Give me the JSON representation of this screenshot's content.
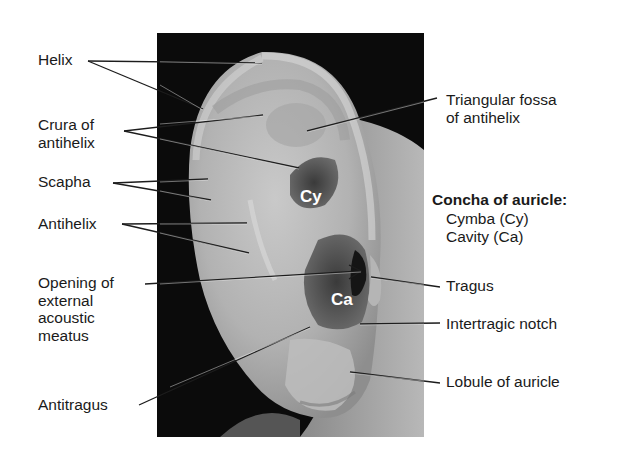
{
  "figure": {
    "photo_region": {
      "x": 157,
      "y": 33,
      "width": 267,
      "height": 404
    },
    "colors": {
      "background": "#ffffff",
      "photo_bg": "#0a0a0a",
      "skin_light": "#cfcfcf",
      "skin_mid": "#a8a8a8",
      "skin_dark": "#4a4a4a",
      "leader_line": "#222222",
      "text": "#1a1a1a",
      "photo_label": "#ffffff"
    }
  },
  "labels_left": [
    {
      "id": "helix",
      "text": "Helix",
      "x": 38,
      "y": 51
    },
    {
      "id": "crura",
      "text": "Crura of\nantihelix",
      "x": 38,
      "y": 116
    },
    {
      "id": "scapha",
      "text": "Scapha",
      "x": 38,
      "y": 173
    },
    {
      "id": "antihelix",
      "text": "Antihelix",
      "x": 38,
      "y": 215
    },
    {
      "id": "opening",
      "text": "Opening of\nexternal\nacoustic\nmeatus",
      "x": 38,
      "y": 272
    },
    {
      "id": "antitragus",
      "text": "Antitragus",
      "x": 38,
      "y": 397
    }
  ],
  "labels_right": [
    {
      "id": "triangular-fossa",
      "text": "Triangular fossa\nof antihelix",
      "x": 446,
      "y": 92
    },
    {
      "id": "tragus",
      "text": "Tragus",
      "x": 446,
      "y": 277
    },
    {
      "id": "intertragic-notch",
      "text": "Intertragic notch",
      "x": 446,
      "y": 316
    },
    {
      "id": "lobule",
      "text": "Lobule of auricle",
      "x": 446,
      "y": 374
    }
  ],
  "concha_legend": {
    "title": "Concha of auricle:",
    "items": [
      "Cymba (Cy)",
      "Cavity (Ca)"
    ],
    "x": 432,
    "y": 180
  },
  "photo_labels": [
    {
      "id": "cy",
      "text": "Cy",
      "x": 301,
      "y": 186
    },
    {
      "id": "ca",
      "text": "Ca",
      "x": 330,
      "y": 289
    }
  ],
  "leader_lines": [
    {
      "from": [
        88,
        61
      ],
      "to": [
        262,
        63
      ],
      "label": "helix"
    },
    {
      "from": [
        88,
        61
      ],
      "to": [
        203,
        109
      ],
      "label": "helix"
    },
    {
      "from": [
        124,
        131
      ],
      "to": [
        263,
        115
      ],
      "label": "crura"
    },
    {
      "from": [
        124,
        131
      ],
      "to": [
        299,
        168
      ],
      "label": "crura"
    },
    {
      "from": [
        113,
        183
      ],
      "to": [
        208,
        179
      ],
      "label": "scapha"
    },
    {
      "from": [
        113,
        183
      ],
      "to": [
        211,
        200
      ],
      "label": "scapha"
    },
    {
      "from": [
        122,
        224
      ],
      "to": [
        247,
        223
      ],
      "label": "antihelix"
    },
    {
      "from": [
        122,
        224
      ],
      "to": [
        249,
        253
      ],
      "label": "antihelix"
    },
    {
      "from": [
        145,
        284
      ],
      "to": [
        361,
        271
      ],
      "label": "opening",
      "arrow": true
    },
    {
      "from": [
        139,
        405
      ],
      "to": [
        310,
        327
      ],
      "label": "antitragus"
    },
    {
      "from": [
        437,
        98
      ],
      "to": [
        307,
        131
      ],
      "label": "triangular-fossa"
    },
    {
      "from": [
        440,
        287
      ],
      "to": [
        371,
        277
      ],
      "label": "tragus"
    },
    {
      "from": [
        440,
        323
      ],
      "to": [
        360,
        324
      ],
      "label": "intertragic-notch"
    },
    {
      "from": [
        440,
        383
      ],
      "to": [
        350,
        372
      ],
      "label": "lobule"
    }
  ]
}
